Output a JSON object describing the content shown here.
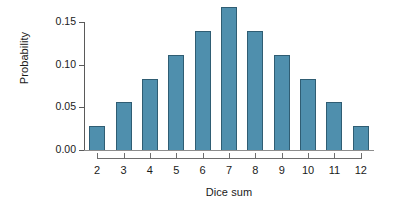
{
  "chart_data": {
    "type": "bar",
    "title": "",
    "xlabel": "Dice sum",
    "ylabel": "Probability",
    "categories": [
      "2",
      "3",
      "4",
      "5",
      "6",
      "7",
      "8",
      "9",
      "10",
      "11",
      "12"
    ],
    "values": [
      0.028,
      0.056,
      0.083,
      0.111,
      0.139,
      0.167,
      0.139,
      0.111,
      0.083,
      0.056,
      0.028
    ],
    "ylim": [
      0.0,
      0.15
    ],
    "xlim": [
      "2",
      "12"
    ],
    "ytick_labels": [
      "0.00",
      "0.05",
      "0.10",
      "0.15"
    ],
    "ytick_values": [
      0.0,
      0.05,
      0.1,
      0.15
    ],
    "xtick_labels": [
      "2",
      "3",
      "4",
      "5",
      "6",
      "7",
      "8",
      "9",
      "10",
      "11",
      "12"
    ],
    "grid": false,
    "legend": null,
    "series": [
      {
        "name": "Probability",
        "values": [
          0.028,
          0.056,
          0.083,
          0.111,
          0.139,
          0.167,
          0.139,
          0.111,
          0.083,
          0.056,
          0.028
        ]
      }
    ],
    "colors": {
      "bar_fill": "#4f8fad",
      "bar_edge": "#2f5d73",
      "axis": "#6e6e6e",
      "text": "#1a1a1a",
      "background": "#ffffff"
    }
  }
}
